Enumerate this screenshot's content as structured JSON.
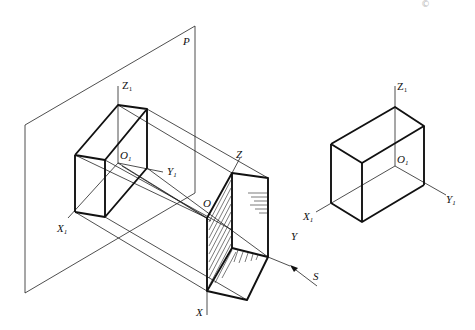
{
  "figure": {
    "plane_label": "P",
    "projection_direction_label": "S",
    "projected_view": {
      "origin_label": "O",
      "origin_sub": "1",
      "x_axis_label": "X",
      "x_axis_sub": "1",
      "y_axis_label": "Y",
      "y_axis_sub": "1",
      "z_axis_label": "Z",
      "z_axis_sub": "1"
    },
    "object": {
      "origin_label": "O",
      "x_axis_label": "X",
      "y_axis_label": "Y",
      "z_axis_label": "Z"
    },
    "result_view": {
      "origin_label": "O",
      "origin_sub": "1",
      "x_axis_label": "X",
      "x_axis_sub": "1",
      "y_axis_label": "Y",
      "y_axis_sub": "1",
      "z_axis_label": "Z",
      "z_axis_sub": "1"
    },
    "corner_mark": "©"
  }
}
